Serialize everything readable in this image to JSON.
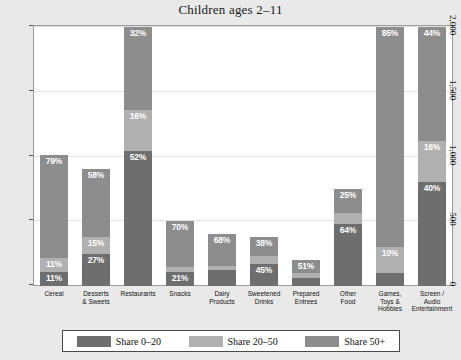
{
  "chart_data": {
    "type": "bar",
    "title": "Children ages 2–11",
    "xlabel": "",
    "ylabel": "",
    "ylim": [
      0,
      2000
    ],
    "yticks": [
      "0",
      "500",
      "1,000",
      "1,500",
      "2,000"
    ],
    "ytick_values": [
      0,
      500,
      1000,
      1500,
      2000
    ],
    "grid": true,
    "stacked": true,
    "legend_position": "bottom",
    "categories": [
      "Cereal",
      "Desserts & Sweets",
      "Restaurants",
      "Snacks",
      "Dairy Products",
      "Sweetened Drinks",
      "Prepared Entrees",
      "Other Food",
      "Games, Toys & Hobbies",
      "Screen / Audio Entertainment"
    ],
    "category_lines": [
      [
        "Cereal"
      ],
      [
        "Desserts",
        "& Sweets"
      ],
      [
        "Restaurants"
      ],
      [
        "Snacks"
      ],
      [
        "Dairy",
        "Products"
      ],
      [
        "Sweetened",
        "Drinks"
      ],
      [
        "Prepared",
        "Entrees"
      ],
      [
        "Other",
        "Food"
      ],
      [
        "Games,",
        "Toys &",
        "Hobbies"
      ],
      [
        "Screen /",
        "Audio",
        "Entertainment"
      ]
    ],
    "series": [
      {
        "name": "Share 0–20",
        "color": "#6e6e6e",
        "values": [
          110,
          245,
          1040,
          105,
          120,
          170,
          60,
          480,
          100,
          800
        ],
        "labels": [
          "11%",
          "27%",
          "52%",
          "21%",
          "",
          "45%",
          "",
          "64%",
          "",
          "40%"
        ]
      },
      {
        "name": "Share 20–50",
        "color": "#b0b0b0",
        "values": [
          110,
          135,
          320,
          45,
          35,
          65,
          38,
          82,
          200,
          320
        ],
        "labels": [
          "11%",
          "15%",
          "16%",
          "",
          "",
          "",
          "",
          "",
          "10%",
          "16%"
        ]
      },
      {
        "name": "Share 50+",
        "color": "#8d8d8d",
        "values": [
          790,
          520,
          640,
          350,
          245,
          145,
          102,
          188,
          1700,
          880
        ],
        "labels": [
          "79%",
          "58%",
          "32%",
          "70%",
          "68%",
          "38%",
          "51%",
          "25%",
          "85%",
          "44%"
        ]
      }
    ],
    "totals": [
      1010,
      900,
      2000,
      500,
      400,
      380,
      200,
      750,
      2000,
      2000
    ]
  },
  "legend": {
    "items": [
      {
        "label": "Share 0–20",
        "color": "#6e6e6e"
      },
      {
        "label": "Share 20–50",
        "color": "#b0b0b0"
      },
      {
        "label": "Share 50+",
        "color": "#8d8d8d"
      }
    ]
  }
}
